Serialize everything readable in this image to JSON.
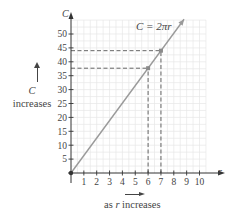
{
  "chart_data": {
    "type": "line",
    "title": "",
    "equation_label": "C = 2πr",
    "xlabel": "r",
    "ylabel": "C",
    "x_ticks": [
      "1",
      "2",
      "3",
      "4",
      "5",
      "6",
      "7",
      "8",
      "9",
      "10"
    ],
    "y_ticks": [
      "5",
      "10",
      "15",
      "20",
      "25",
      "30",
      "35",
      "40",
      "45",
      "50"
    ],
    "xlim": [
      0,
      10.5
    ],
    "ylim": [
      0,
      55
    ],
    "grid": true,
    "series": [
      {
        "name": "C = 2πr",
        "x": [
          0,
          8.8
        ],
        "y": [
          0,
          55.3
        ],
        "color": "#9a9a9a"
      }
    ],
    "highlighted_points": [
      {
        "x": 6,
        "y": 37.7
      },
      {
        "x": 7,
        "y": 44.0
      }
    ],
    "reference_lines": [
      {
        "type": "dashed",
        "from": [
          0,
          37.7
        ],
        "to": [
          6,
          37.7
        ]
      },
      {
        "type": "dashed",
        "from": [
          6,
          0
        ],
        "to": [
          6,
          37.7
        ]
      },
      {
        "type": "dashed",
        "from": [
          0,
          44.0
        ],
        "to": [
          7,
          44.0
        ]
      },
      {
        "type": "dashed",
        "from": [
          7,
          0
        ],
        "to": [
          7,
          44.0
        ]
      }
    ],
    "annotations": {
      "y_direction": "C\nincreases",
      "x_direction": "as r increases"
    }
  },
  "labels": {
    "y_axis": "C",
    "x_axis": "r",
    "equation": "C = 2πr",
    "side_c": "C",
    "side_increases": "increases",
    "bottom_as": "as ",
    "bottom_r": "r",
    "bottom_increases": " increases"
  },
  "colors": {
    "line": "#9a9a9a",
    "axis": "#333333",
    "grid": "#e6e6e6",
    "dash": "#555555",
    "point": "#8a8a8a"
  }
}
